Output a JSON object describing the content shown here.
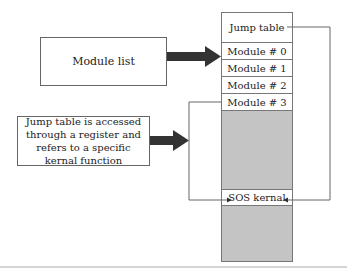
{
  "diagram": {
    "left_boxes": [
      {
        "id": "module-list",
        "label": "Module list"
      },
      {
        "id": "jump-table-note",
        "label": "Jump table is accessed through a register and refers to a specific kernal function"
      }
    ],
    "memory_column": {
      "cells": [
        {
          "label": "Jump table"
        },
        {
          "label": "Module # 0"
        },
        {
          "label": "Module # 1"
        },
        {
          "label": "Module # 2"
        },
        {
          "label": "Module # 3"
        },
        {
          "label": ""
        },
        {
          "label": "SOS kernal"
        },
        {
          "label": ""
        }
      ]
    },
    "colors": {
      "gray_region": "#c4c4c4",
      "arrow": "#333333",
      "line": "#666666"
    }
  }
}
